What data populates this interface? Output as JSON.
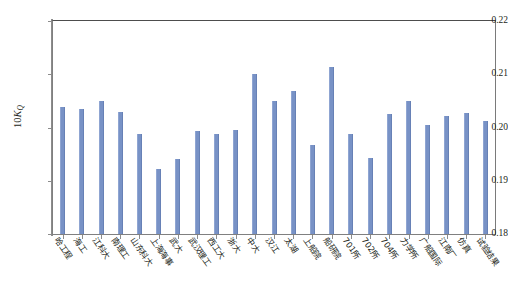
{
  "chart_data": {
    "type": "bar",
    "title": "",
    "xlabel": "",
    "ylabel": "10K_Q",
    "ylabel_parts": {
      "prefix": "10",
      "symbol": "K",
      "subscript": "Q"
    },
    "ylim": [
      0.18,
      0.22
    ],
    "ytick_labels": [
      "0.22",
      "0.21",
      "0.20",
      "0.19",
      "0.18"
    ],
    "ytick_values": [
      0.22,
      0.21,
      0.2,
      0.19,
      0.18
    ],
    "grid": false,
    "legend": "none",
    "bar_color": "#7892c6",
    "categories": [
      "哈工程",
      "海工",
      "江科大",
      "南理工",
      "山东科大",
      "上海海事",
      "武大",
      "武汉理工",
      "西工大",
      "浙大",
      "中大",
      "汉江",
      "太湖",
      "上船院",
      "船研院",
      "701所",
      "702所",
      "704所",
      "力学所",
      "广船国际",
      "江南厂",
      "仿真",
      "试验结果"
    ],
    "values": [
      0.2038,
      0.2035,
      0.205,
      0.203,
      0.1988,
      0.1922,
      0.194,
      0.1993,
      0.1988,
      0.1996,
      0.21,
      0.205,
      0.2068,
      0.1967,
      0.2113,
      0.1988,
      0.1942,
      0.2025,
      0.205,
      0.2005,
      0.2022,
      0.2028,
      0.2012
    ]
  }
}
